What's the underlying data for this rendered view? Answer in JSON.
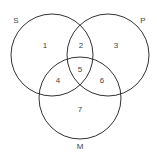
{
  "diagram": {
    "type": "venn",
    "sets": [
      {
        "id": "S",
        "label": "S"
      },
      {
        "id": "P",
        "label": "P"
      },
      {
        "id": "M",
        "label": "M"
      }
    ],
    "regions": [
      {
        "id": "1",
        "label": "1",
        "sets": [
          "S"
        ]
      },
      {
        "id": "2",
        "label": "2",
        "sets": [
          "S",
          "P"
        ]
      },
      {
        "id": "3",
        "label": "3",
        "sets": [
          "P"
        ]
      },
      {
        "id": "4",
        "label": "4",
        "sets": [
          "S",
          "M"
        ]
      },
      {
        "id": "5",
        "label": "5",
        "sets": [
          "S",
          "P",
          "M"
        ]
      },
      {
        "id": "6",
        "label": "6",
        "sets": [
          "P",
          "M"
        ]
      },
      {
        "id": "7",
        "label": "7",
        "sets": [
          "M"
        ]
      }
    ],
    "colors": {
      "stroke": "#333333",
      "text": "#444444",
      "background": "#ffffff"
    }
  }
}
